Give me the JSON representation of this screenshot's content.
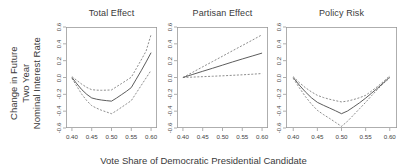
{
  "figure": {
    "xlabel": "Vote Share of Democratic Presidential Candidate",
    "ylabel_lines": [
      "Change in Future",
      "Two Year",
      "Nominal Interest Rate"
    ],
    "background_color": "#ffffff",
    "solid_line_color": "#4a4a4a",
    "dashed_line_color": "#6e6e6e",
    "axis_color": "#9a9a9a"
  },
  "chart_data": [
    {
      "type": "line",
      "title": "Total Effect",
      "xlabel": "Vote Share of Democratic Presidential Candidate",
      "ylabel": "Change in Future Two Year Nominal Interest Rate",
      "xlim": [
        0.385,
        0.615
      ],
      "ylim": [
        -0.6,
        0.6
      ],
      "xticks": [
        0.4,
        0.45,
        0.5,
        0.55,
        0.6
      ],
      "xtick_labels": [
        "0.40",
        "0.45",
        "0.50",
        "0.55",
        "0.60"
      ],
      "yticks": [
        -0.6,
        -0.4,
        -0.2,
        0.0,
        0.2,
        0.4,
        0.6
      ],
      "ytick_labels": [
        "-0.6",
        "-0.4",
        "-0.2",
        "0.0",
        "0.2",
        "0.4",
        "0.6"
      ],
      "grid": false,
      "legend": "none",
      "x": [
        0.4,
        0.4125,
        0.425,
        0.4375,
        0.45,
        0.4625,
        0.475,
        0.4875,
        0.5,
        0.5125,
        0.525,
        0.5375,
        0.55,
        0.5625,
        0.575,
        0.5875,
        0.6
      ],
      "series": [
        {
          "name": "Point estimate",
          "style": "solid",
          "values": [
            0.0,
            -0.075,
            -0.145,
            -0.2,
            -0.243,
            -0.258,
            -0.268,
            -0.275,
            -0.281,
            -0.245,
            -0.205,
            -0.165,
            -0.12,
            -0.02,
            0.08,
            0.185,
            0.295
          ]
        },
        {
          "name": "Upper 95% confidence bound",
          "style": "dashed",
          "values": [
            0.01,
            -0.035,
            -0.08,
            -0.118,
            -0.145,
            -0.15,
            -0.152,
            -0.15,
            -0.148,
            -0.11,
            -0.073,
            -0.035,
            0.003,
            0.105,
            0.208,
            0.315,
            0.51
          ]
        },
        {
          "name": "Lower 95% confidence bound",
          "style": "dashed",
          "values": [
            -0.01,
            -0.105,
            -0.2,
            -0.275,
            -0.335,
            -0.365,
            -0.39,
            -0.41,
            -0.43,
            -0.395,
            -0.355,
            -0.315,
            -0.275,
            -0.185,
            -0.095,
            -0.005,
            0.085
          ]
        }
      ]
    },
    {
      "type": "line",
      "title": "Partisan Effect",
      "xlabel": "Vote Share of Democratic Presidential Candidate",
      "ylabel": "Change in Future Two Year Nominal Interest Rate",
      "xlim": [
        0.385,
        0.615
      ],
      "ylim": [
        -0.6,
        0.6
      ],
      "xticks": [
        0.4,
        0.45,
        0.5,
        0.55,
        0.6
      ],
      "xtick_labels": [
        "0.40",
        "0.45",
        "0.50",
        "0.55",
        "0.60"
      ],
      "yticks": [
        -0.6,
        -0.4,
        -0.2,
        0.0,
        0.2,
        0.4,
        0.6
      ],
      "ytick_labels": [
        "-0.6",
        "-0.4",
        "-0.2",
        "0.0",
        "0.2",
        "0.4",
        "0.6"
      ],
      "grid": false,
      "legend": "none",
      "x": [
        0.4,
        0.425,
        0.45,
        0.475,
        0.5,
        0.525,
        0.55,
        0.575,
        0.6
      ],
      "series": [
        {
          "name": "Point estimate",
          "style": "solid",
          "values": [
            0.0,
            0.037,
            0.074,
            0.11,
            0.147,
            0.184,
            0.22,
            0.255,
            0.29
          ]
        },
        {
          "name": "Upper 95% confidence bound",
          "style": "dashed",
          "values": [
            0.0,
            0.063,
            0.127,
            0.19,
            0.253,
            0.317,
            0.38,
            0.443,
            0.508
          ]
        },
        {
          "name": "Lower 95% confidence bound",
          "style": "dashed",
          "values": [
            0.0,
            0.005,
            0.01,
            0.015,
            0.02,
            0.026,
            0.032,
            0.039,
            0.047
          ]
        }
      ]
    },
    {
      "type": "line",
      "title": "Policy Risk",
      "xlabel": "Vote Share of Democratic Presidential Candidate",
      "ylabel": "Change in Future Two Year Nominal Interest Rate",
      "xlim": [
        0.385,
        0.615
      ],
      "ylim": [
        -0.6,
        0.6
      ],
      "xticks": [
        0.4,
        0.45,
        0.5,
        0.55,
        0.6
      ],
      "xtick_labels": [
        "0.40",
        "0.45",
        "0.50",
        "0.55",
        "0.60"
      ],
      "yticks": [
        -0.6,
        -0.4,
        -0.2,
        0.0,
        0.2,
        0.4,
        0.6
      ],
      "ytick_labels": [
        "-0.6",
        "-0.4",
        "-0.2",
        "0.0",
        "0.2",
        "0.4",
        "0.6"
      ],
      "grid": false,
      "legend": "none",
      "x": [
        0.4,
        0.4125,
        0.425,
        0.4375,
        0.45,
        0.4625,
        0.475,
        0.4875,
        0.5,
        0.5125,
        0.525,
        0.5375,
        0.55,
        0.5625,
        0.575,
        0.5875,
        0.6
      ],
      "series": [
        {
          "name": "Point estimate",
          "style": "solid",
          "values": [
            0.0,
            -0.09,
            -0.17,
            -0.24,
            -0.295,
            -0.33,
            -0.362,
            -0.395,
            -0.43,
            -0.398,
            -0.35,
            -0.3,
            -0.245,
            -0.185,
            -0.125,
            -0.06,
            0.005
          ]
        },
        {
          "name": "Upper 95% confidence bound",
          "style": "dashed",
          "values": [
            0.01,
            -0.06,
            -0.12,
            -0.17,
            -0.212,
            -0.238,
            -0.258,
            -0.275,
            -0.29,
            -0.28,
            -0.262,
            -0.24,
            -0.212,
            -0.16,
            -0.105,
            -0.045,
            0.02
          ]
        },
        {
          "name": "Lower 95% confidence bound",
          "style": "dashed",
          "values": [
            -0.01,
            -0.12,
            -0.225,
            -0.315,
            -0.39,
            -0.44,
            -0.485,
            -0.533,
            -0.58,
            -0.52,
            -0.445,
            -0.37,
            -0.295,
            -0.215,
            -0.14,
            -0.068,
            -0.005
          ]
        }
      ]
    }
  ]
}
